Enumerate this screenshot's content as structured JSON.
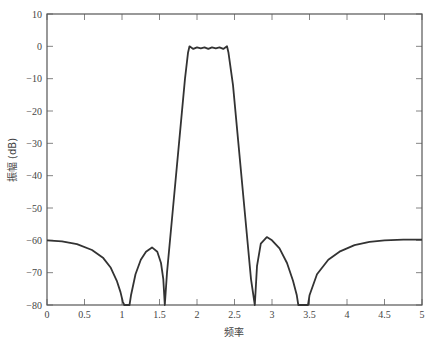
{
  "chart_data": {
    "type": "line",
    "title": "",
    "xlabel": "频率",
    "ylabel": "振幅 (dB)",
    "xlim": [
      0,
      5
    ],
    "ylim": [
      -80,
      10
    ],
    "xticks": [
      0,
      0.5,
      1,
      1.5,
      2,
      2.5,
      3,
      3.5,
      4,
      4.5,
      5
    ],
    "xtick_labels": [
      "0",
      "0.5",
      "1",
      "1.5",
      "2",
      "2.5",
      "3",
      "3.5",
      "4",
      "4.5",
      "5"
    ],
    "yticks": [
      10,
      0,
      -10,
      -20,
      -30,
      -40,
      -50,
      -60,
      -70,
      -80
    ],
    "ytick_labels": [
      "10",
      "0",
      "−10",
      "−20",
      "−30",
      "−40",
      "−50",
      "−60",
      "−70",
      "−80"
    ],
    "grid": false,
    "legend": null,
    "series": [
      {
        "name": "magnitude response",
        "color": "#333333",
        "x": [
          0,
          0.2,
          0.4,
          0.6,
          0.75,
          0.85,
          0.93,
          0.98,
          1.01,
          1.03,
          1.1,
          1.12,
          1.18,
          1.25,
          1.32,
          1.4,
          1.47,
          1.52,
          1.55,
          1.57,
          1.6,
          1.68,
          1.76,
          1.84,
          1.88,
          1.9,
          1.95,
          2.0,
          2.05,
          2.1,
          2.15,
          2.2,
          2.25,
          2.3,
          2.35,
          2.4,
          2.42,
          2.48,
          2.56,
          2.64,
          2.72,
          2.77,
          2.8,
          2.85,
          2.93,
          3.0,
          3.1,
          3.2,
          3.28,
          3.33,
          3.35,
          3.48,
          3.5,
          3.6,
          3.75,
          3.9,
          4.1,
          4.3,
          4.5,
          4.75,
          5.0
        ],
        "y": [
          -60,
          -60.3,
          -61.2,
          -63,
          -65.5,
          -68.5,
          -72.5,
          -76,
          -79,
          -80,
          -80,
          -77,
          -70.5,
          -66,
          -63.5,
          -62.2,
          -63.5,
          -67,
          -72,
          -80,
          -70,
          -50,
          -30,
          -10,
          -2,
          0,
          -0.8,
          -0.3,
          -0.6,
          -0.3,
          -0.8,
          -0.3,
          -0.6,
          -0.3,
          -0.8,
          0,
          -2,
          -12,
          -32,
          -52,
          -72,
          -80,
          -68,
          -61,
          -59,
          -60,
          -62.5,
          -67,
          -72.5,
          -77,
          -80,
          -80,
          -77,
          -70.5,
          -66,
          -63.5,
          -61.5,
          -60.5,
          -60,
          -59.8,
          -59.8
        ]
      }
    ]
  }
}
